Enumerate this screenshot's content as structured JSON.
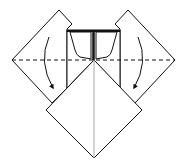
{
  "diagram": {
    "colors": {
      "line": "#111111",
      "paper": "#ffffff",
      "center_crease": "#aaaaaa"
    },
    "elements": [
      {
        "name": "left-flap",
        "shape": "square-diamond"
      },
      {
        "name": "right-flap",
        "shape": "square-diamond"
      },
      {
        "name": "center-pocket",
        "shape": "trapezoid-flaps"
      },
      {
        "name": "bottom-diamond",
        "shape": "square-diamond"
      },
      {
        "name": "valley-fold-line",
        "style": "dashed"
      },
      {
        "name": "left-fold-arrow",
        "direction": "down-curved"
      },
      {
        "name": "right-fold-arrow",
        "direction": "down-curved"
      }
    ]
  }
}
